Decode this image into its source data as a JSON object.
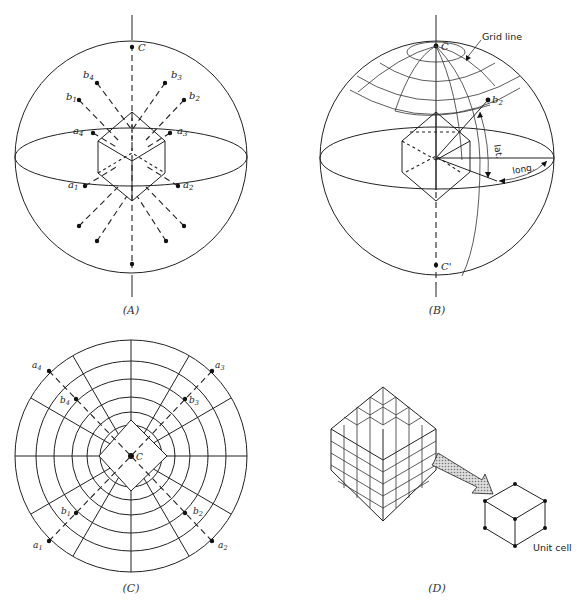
{
  "figure": {
    "panels": [
      {
        "id": "A",
        "caption": "(A)",
        "description": "Cubic crystal at center of sphere with face normals (a) and body-diagonal normals (b) projected to the sphere surface",
        "labels": {
          "c": "C",
          "b4": "b",
          "b4_sub": "4",
          "b3": "b",
          "b3_sub": "3",
          "b1": "b",
          "b1_sub": "1",
          "b2": "b",
          "b2_sub": "2",
          "a4": "a",
          "a4_sub": "4",
          "a3": "a",
          "a3_sub": "3",
          "a1": "a",
          "a1_sub": "1",
          "a2": "a",
          "a2_sub": "2"
        }
      },
      {
        "id": "B",
        "caption": "(B)",
        "description": "Sphere with latitude/longitude grid showing pole b2 location",
        "labels": {
          "grid_line": "Grid line",
          "c": "C",
          "c_prime": "C'",
          "b2": "b",
          "b2_sub": "2",
          "lat": "lat.",
          "long": "long."
        }
      },
      {
        "id": "C",
        "caption": "(C)",
        "description": "Stereographic projection of poles viewed down C axis",
        "labels": {
          "c": "C",
          "a4": "a",
          "a4_sub": "4",
          "a3": "a",
          "a3_sub": "3",
          "a1": "a",
          "a1_sub": "1",
          "a2": "a",
          "a2_sub": "2",
          "b4": "b",
          "b4_sub": "4",
          "b3": "b",
          "b3_sub": "3",
          "b1": "b",
          "b1_sub": "1",
          "b2": "b",
          "b2_sub": "2"
        }
      },
      {
        "id": "D",
        "caption": "(D)",
        "description": "Crystal built from stacked unit cells",
        "labels": {
          "unit_cell": "Unit cell"
        }
      }
    ]
  }
}
